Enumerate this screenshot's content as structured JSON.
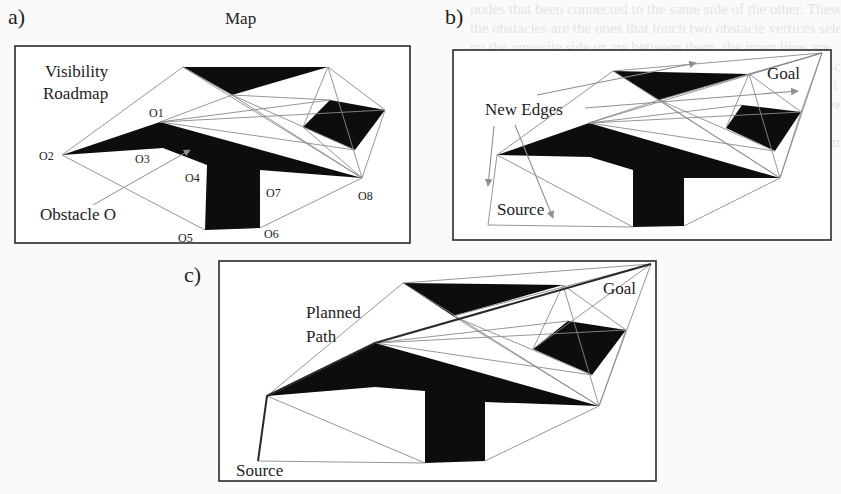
{
  "figure": {
    "background_text_lines": [
      "nodes that been connected to the same side of the other. These are",
      "the obstacles are the ones that touch two obstacle vertices selected to",
      "on the opposite side or are between them, the inner lines are",
      "supporting lines, obtained by connecting them from the vertices",
      "of the obstacle. as shown in the figure. The final edge as well",
      "is connected, and it also can edge all the vertex pairs. In a new",
      "for a given map. The planned path and one of the",
      "are shown in figure. The path traces obstacle boundaries in small"
    ],
    "panels": [
      {
        "id": "a",
        "label": "a)",
        "title": "Map",
        "annotations": {
          "roadmap_label_line1": "Visibility",
          "roadmap_label_line2": "Roadmap",
          "obstacle_label": "Obstacle O"
        },
        "vertex_labels": [
          "O1",
          "O2",
          "O3",
          "O4",
          "O5",
          "O6",
          "O7",
          "O8"
        ]
      },
      {
        "id": "b",
        "label": "b)",
        "annotations": {
          "new_edges_label": "New Edges",
          "goal_label": "Goal",
          "source_label": "Source"
        }
      },
      {
        "id": "c",
        "label": "c)",
        "annotations": {
          "planned_path_line1": "Planned",
          "planned_path_line2": "Path",
          "goal_label": "Goal",
          "source_label": "Source"
        }
      }
    ],
    "colors": {
      "obstacle": "#0d0d0d",
      "edge": "#8a8a8a",
      "arrow": "#8f8f8f",
      "frame": "#2a2a2a",
      "path": "#2a2a2a"
    }
  }
}
